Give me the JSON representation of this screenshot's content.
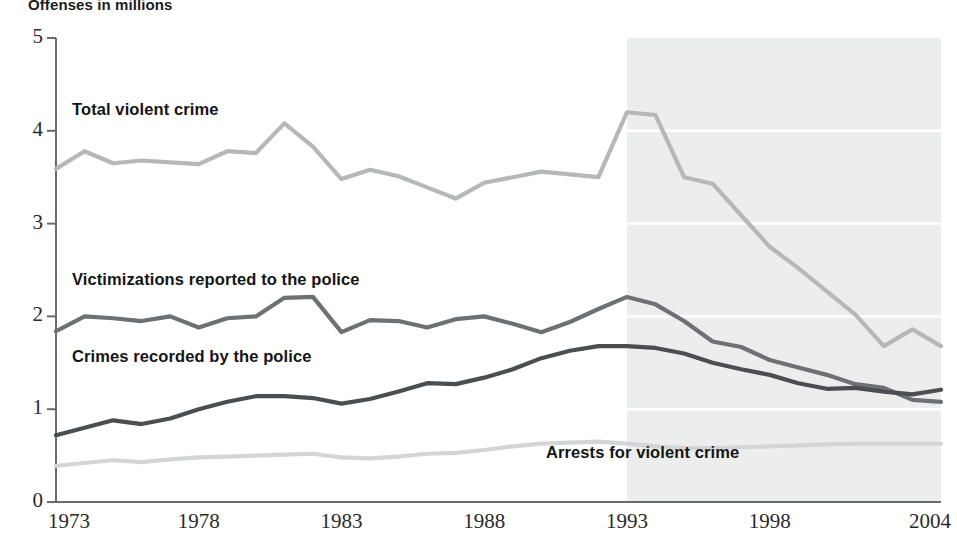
{
  "chart_data": {
    "type": "line",
    "title": "Offenses in millions",
    "xlabel": "",
    "ylabel": "Offenses in millions",
    "xlim": [
      1973,
      2004
    ],
    "ylim": [
      0,
      5
    ],
    "yticks": [
      "0",
      "1",
      "2",
      "3",
      "4",
      "5"
    ],
    "xticks": [
      "1973",
      "1978",
      "1983",
      "1988",
      "1993",
      "1998",
      "2004"
    ],
    "xtick_values": [
      1973,
      1978,
      1983,
      1988,
      1993,
      1998,
      2004
    ],
    "grid": "horizontal-white-lines-inside-shaded-band",
    "legend": "inline-labels",
    "shaded_region": {
      "label": "",
      "x_start": 1993,
      "x_end": 2004,
      "color": "#eceded"
    },
    "x": [
      1973,
      1974,
      1975,
      1976,
      1977,
      1978,
      1979,
      1980,
      1981,
      1982,
      1983,
      1984,
      1985,
      1986,
      1987,
      1988,
      1989,
      1990,
      1991,
      1992,
      1993,
      1994,
      1995,
      1996,
      1997,
      1998,
      1999,
      2000,
      2001,
      2002,
      2003,
      2004
    ],
    "series": [
      {
        "name": "Total violent crime",
        "color": "#b6b7b7",
        "values": [
          3.59,
          3.78,
          3.65,
          3.68,
          3.66,
          3.64,
          3.78,
          3.76,
          4.08,
          3.83,
          3.48,
          3.58,
          3.51,
          3.39,
          3.27,
          3.44,
          3.5,
          3.56,
          3.53,
          3.5,
          4.2,
          4.17,
          3.5,
          3.43,
          3.09,
          2.75,
          2.52,
          2.27,
          2.02,
          1.68,
          1.86,
          1.68
        ]
      },
      {
        "name": "Victimizations reported to the police",
        "color": "#6e7173",
        "values": [
          1.84,
          2.0,
          1.98,
          1.95,
          2.0,
          1.88,
          1.98,
          2.0,
          2.2,
          2.21,
          1.83,
          1.96,
          1.95,
          1.88,
          1.97,
          2.0,
          1.92,
          1.83,
          1.94,
          2.08,
          2.21,
          2.13,
          1.95,
          1.73,
          1.67,
          1.53,
          1.45,
          1.37,
          1.27,
          1.23,
          1.1,
          1.08
        ]
      },
      {
        "name": "Crimes recorded by the police",
        "color": "#4b4e50",
        "values": [
          0.72,
          0.8,
          0.88,
          0.84,
          0.9,
          1.0,
          1.08,
          1.14,
          1.14,
          1.12,
          1.06,
          1.11,
          1.19,
          1.28,
          1.27,
          1.34,
          1.43,
          1.55,
          1.63,
          1.68,
          1.68,
          1.66,
          1.6,
          1.5,
          1.43,
          1.37,
          1.28,
          1.22,
          1.23,
          1.19,
          1.16,
          1.21
        ]
      },
      {
        "name": "Arrests for violent crime",
        "color": "#d4d5d6",
        "values": [
          0.39,
          0.42,
          0.45,
          0.43,
          0.46,
          0.48,
          0.49,
          0.5,
          0.51,
          0.52,
          0.48,
          0.47,
          0.49,
          0.52,
          0.53,
          0.56,
          0.6,
          0.63,
          0.64,
          0.65,
          0.63,
          0.6,
          0.58,
          0.58,
          0.59,
          0.6,
          0.61,
          0.62,
          0.63,
          0.63,
          0.63,
          0.63
        ]
      }
    ],
    "annotations": [
      {
        "text": "Total violent crime",
        "x_px": 72,
        "y_px": 100
      },
      {
        "text": "Victimizations reported to the police",
        "x_px": 72,
        "y_px": 270
      },
      {
        "text": "Crimes recorded by the police",
        "x_px": 72,
        "y_px": 347
      },
      {
        "text": "Arrests for violent crime",
        "x_px": 546,
        "y_px": 443
      }
    ]
  }
}
